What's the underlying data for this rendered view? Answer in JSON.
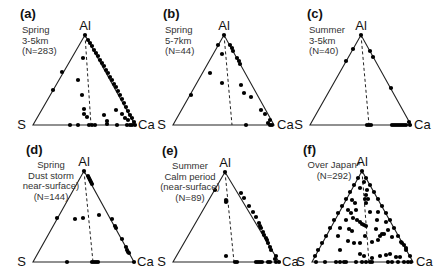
{
  "chart_data": [
    {
      "id": "a",
      "type": "scatter",
      "subtype": "ternary",
      "letter": "(a)",
      "title_lines": [
        "Spring",
        "3-5km",
        "(N=283)"
      ],
      "season": "Spring",
      "altitude": "3-5km",
      "n": 283,
      "vertices": {
        "top": "Al",
        "left": "S",
        "right": "Ca"
      },
      "geometry": {
        "apex": [
          85,
          35
        ],
        "left": [
          33,
          125
        ],
        "right": [
          135,
          125
        ],
        "dash_base_x": 91
      },
      "label_pos": {
        "letter": [
          20,
          18
        ],
        "desc": [
          22,
          33
        ]
      },
      "points_px": [
        [
          85,
          35
        ],
        [
          88,
          40
        ],
        [
          90,
          43
        ],
        [
          92,
          46
        ],
        [
          94,
          50
        ],
        [
          96,
          53
        ],
        [
          98,
          56
        ],
        [
          100,
          60
        ],
        [
          102,
          63
        ],
        [
          104,
          66
        ],
        [
          106,
          70
        ],
        [
          108,
          73
        ],
        [
          110,
          77
        ],
        [
          112,
          80
        ],
        [
          114,
          84
        ],
        [
          116,
          87
        ],
        [
          118,
          91
        ],
        [
          120,
          95
        ],
        [
          122,
          99
        ],
        [
          124,
          103
        ],
        [
          126,
          107
        ],
        [
          128,
          111
        ],
        [
          130,
          115
        ],
        [
          132,
          118
        ],
        [
          134,
          122
        ],
        [
          135,
          125
        ],
        [
          62,
          72
        ],
        [
          53,
          90
        ],
        [
          83,
          58
        ],
        [
          78,
          80
        ],
        [
          82,
          95
        ],
        [
          84,
          109
        ],
        [
          84,
          114
        ],
        [
          87,
          117
        ],
        [
          104,
          115
        ],
        [
          116,
          110
        ],
        [
          122,
          114
        ],
        [
          125,
          118
        ],
        [
          128,
          120
        ],
        [
          107,
          121
        ],
        [
          107,
          124
        ],
        [
          70,
          125
        ],
        [
          78,
          125
        ],
        [
          89,
          125
        ],
        [
          92,
          125
        ],
        [
          95,
          125
        ],
        [
          117,
          125
        ],
        [
          127,
          125
        ],
        [
          130,
          125
        ],
        [
          132,
          125
        ]
      ]
    },
    {
      "id": "b",
      "type": "scatter",
      "subtype": "ternary",
      "letter": "(b)",
      "title_lines": [
        "Spring",
        "5-7km",
        "(N=44)"
      ],
      "season": "Spring",
      "altitude": "5-7km",
      "n": 44,
      "vertices": {
        "top": "Al",
        "left": "S",
        "right": "Ca"
      },
      "geometry": {
        "apex": [
          224,
          35
        ],
        "left": [
          173,
          125
        ],
        "right": [
          274,
          125
        ],
        "dash_base_x": 232
      },
      "label_pos": {
        "letter": [
          163,
          18
        ],
        "desc": [
          165,
          33
        ]
      },
      "points_px": [
        [
          224,
          35
        ],
        [
          218,
          45
        ],
        [
          230,
          45
        ],
        [
          232,
          48
        ],
        [
          233,
          51
        ],
        [
          237,
          58
        ],
        [
          239,
          61
        ],
        [
          240,
          64
        ],
        [
          222,
          54
        ],
        [
          210,
          73
        ],
        [
          222,
          83
        ],
        [
          241,
          85
        ],
        [
          244,
          93
        ],
        [
          251,
          97
        ],
        [
          191,
          95
        ],
        [
          261,
          110
        ],
        [
          265,
          114
        ],
        [
          270,
          120
        ],
        [
          268,
          123
        ],
        [
          272,
          125
        ],
        [
          270,
          125
        ],
        [
          246,
          125
        ]
      ]
    },
    {
      "id": "c",
      "type": "scatter",
      "subtype": "ternary",
      "letter": "(c)",
      "title_lines": [
        "Summer",
        "3-5km",
        "(N=40)"
      ],
      "season": "Summer",
      "altitude": "3-5km",
      "n": 40,
      "vertices": {
        "top": "Al",
        "left": "S",
        "right": "Ca"
      },
      "geometry": {
        "apex": [
          361,
          35
        ],
        "left": [
          310,
          125
        ],
        "right": [
          411,
          125
        ],
        "dash_base_x": 369
      },
      "label_pos": {
        "letter": [
          307,
          18
        ],
        "desc": [
          309,
          33
        ]
      },
      "points_px": [
        [
          361,
          35
        ],
        [
          353,
          49
        ],
        [
          346,
          61
        ],
        [
          370,
          51
        ],
        [
          373,
          57
        ],
        [
          391,
          88
        ],
        [
          409,
          122
        ],
        [
          367,
          125
        ],
        [
          369,
          125
        ],
        [
          371,
          125
        ],
        [
          392,
          125
        ],
        [
          394,
          125
        ],
        [
          396,
          125
        ],
        [
          398,
          125
        ],
        [
          400,
          125
        ],
        [
          402,
          125
        ],
        [
          404,
          125
        ],
        [
          406,
          125
        ],
        [
          410,
          125
        ]
      ]
    },
    {
      "id": "d",
      "type": "scatter",
      "subtype": "ternary",
      "letter": "(d)",
      "title_lines": [
        "Spring",
        "Dust storm",
        "near-surface)",
        "(N=144)"
      ],
      "season": "Spring",
      "condition": "Dust storm near-surface",
      "n": 144,
      "vertices": {
        "top": "Al",
        "left": "S",
        "right": "Ca"
      },
      "geometry": {
        "apex": [
          84,
          171
        ],
        "left": [
          33,
          262
        ],
        "right": [
          134,
          262
        ],
        "dash_base_x": 93
      },
      "label_pos": {
        "letter": [
          26,
          154
        ],
        "desc": [
          51,
          168
        ]
      },
      "points_px": [
        [
          84,
          171
        ],
        [
          88,
          176
        ],
        [
          89,
          178
        ],
        [
          90,
          180
        ],
        [
          91,
          182
        ],
        [
          92,
          184
        ],
        [
          57,
          218
        ],
        [
          75,
          219
        ],
        [
          83,
          218
        ],
        [
          99,
          215
        ],
        [
          112,
          219
        ],
        [
          115,
          226
        ],
        [
          116,
          228
        ],
        [
          122,
          239
        ],
        [
          126,
          247
        ],
        [
          127,
          250
        ],
        [
          128,
          252
        ],
        [
          129,
          253
        ],
        [
          134,
          262
        ],
        [
          67,
          262
        ],
        [
          92,
          262
        ],
        [
          94,
          262
        ],
        [
          96,
          262
        ],
        [
          98,
          262
        ]
      ]
    },
    {
      "id": "e",
      "type": "scatter",
      "subtype": "ternary",
      "letter": "(e)",
      "title_lines": [
        "Summer",
        "Calm period",
        "(near-surface)",
        "(N=89)"
      ],
      "season": "Summer",
      "condition": "Calm period (near-surface)",
      "n": 89,
      "vertices": {
        "top": "Al",
        "left": "S",
        "right": "Ca"
      },
      "geometry": {
        "apex": [
          225,
          172
        ],
        "left": [
          173,
          262
        ],
        "right": [
          279,
          262
        ],
        "dash_base_x": 234
      },
      "label_pos": {
        "letter": [
          162,
          155
        ],
        "desc": [
          190,
          169
        ]
      },
      "points_px": [
        [
          225,
          172
        ],
        [
          215,
          190
        ],
        [
          226,
          200
        ],
        [
          226,
          202
        ],
        [
          241,
          193
        ],
        [
          244,
          198
        ],
        [
          249,
          206
        ],
        [
          253,
          212
        ],
        [
          256,
          217
        ],
        [
          259,
          223
        ],
        [
          260,
          226
        ],
        [
          261,
          228
        ],
        [
          263,
          232
        ],
        [
          264,
          235
        ],
        [
          266,
          238
        ],
        [
          267,
          240
        ],
        [
          268,
          243
        ],
        [
          270,
          247
        ],
        [
          271,
          250
        ],
        [
          276,
          256
        ],
        [
          275,
          259
        ],
        [
          226,
          256
        ],
        [
          235,
          262
        ],
        [
          237,
          262
        ],
        [
          256,
          262
        ],
        [
          258,
          262
        ],
        [
          260,
          262
        ],
        [
          262,
          262
        ],
        [
          268,
          262
        ],
        [
          270,
          262
        ],
        [
          276,
          262
        ],
        [
          279,
          262
        ]
      ]
    },
    {
      "id": "f",
      "type": "scatter",
      "subtype": "ternary",
      "letter": "(f)",
      "title_lines": [
        "Over Japan*",
        "(N=292)"
      ],
      "location": "Over Japan*",
      "n": 292,
      "vertices": {
        "top": "Al",
        "left": "S",
        "right": "Ca"
      },
      "geometry": {
        "apex": [
          362,
          171
        ],
        "left": [
          312,
          262
        ],
        "right": [
          413,
          262
        ],
        "dash_base_x": 369
      },
      "label_pos": {
        "letter": [
          303,
          154
        ],
        "desc": [
          334,
          168
        ]
      },
      "points_px": [
        [
          362,
          171
        ],
        [
          358,
          178
        ],
        [
          354,
          185
        ],
        [
          350,
          192
        ],
        [
          346,
          199
        ],
        [
          342,
          206
        ],
        [
          338,
          213
        ],
        [
          334,
          220
        ],
        [
          330,
          228
        ],
        [
          326,
          236
        ],
        [
          322,
          243
        ],
        [
          318,
          250
        ],
        [
          315,
          256
        ],
        [
          366,
          178
        ],
        [
          370,
          185
        ],
        [
          374,
          192
        ],
        [
          378,
          199
        ],
        [
          382,
          206
        ],
        [
          386,
          213
        ],
        [
          390,
          220
        ],
        [
          394,
          228
        ],
        [
          398,
          236
        ],
        [
          402,
          243
        ],
        [
          406,
          250
        ],
        [
          410,
          256
        ],
        [
          364,
          182
        ],
        [
          360,
          188
        ],
        [
          367,
          190
        ],
        [
          366,
          195
        ],
        [
          365,
          199
        ],
        [
          368,
          199
        ],
        [
          366,
          203
        ],
        [
          352,
          200
        ],
        [
          355,
          203
        ],
        [
          348,
          210
        ],
        [
          351,
          213
        ],
        [
          356,
          210
        ],
        [
          353,
          218
        ],
        [
          346,
          220
        ],
        [
          357,
          220
        ],
        [
          360,
          222
        ],
        [
          362,
          224
        ],
        [
          364,
          225
        ],
        [
          366,
          226
        ],
        [
          370,
          212
        ],
        [
          378,
          212
        ],
        [
          377,
          220
        ],
        [
          386,
          222
        ],
        [
          388,
          230
        ],
        [
          384,
          234
        ],
        [
          380,
          236
        ],
        [
          378,
          240
        ],
        [
          376,
          229
        ],
        [
          349,
          229
        ],
        [
          352,
          231
        ],
        [
          338,
          236
        ],
        [
          340,
          228
        ],
        [
          348,
          241
        ],
        [
          354,
          243
        ],
        [
          360,
          243
        ],
        [
          365,
          236
        ],
        [
          372,
          242
        ],
        [
          382,
          234
        ],
        [
          392,
          237
        ],
        [
          401,
          242
        ],
        [
          404,
          245
        ],
        [
          406,
          248
        ],
        [
          340,
          250
        ],
        [
          360,
          254
        ],
        [
          364,
          256
        ],
        [
          372,
          258
        ],
        [
          380,
          256
        ],
        [
          386,
          255
        ],
        [
          390,
          254
        ],
        [
          396,
          257
        ],
        [
          400,
          257
        ],
        [
          316,
          262
        ],
        [
          325,
          262
        ],
        [
          336,
          262
        ],
        [
          340,
          262
        ],
        [
          344,
          262
        ],
        [
          346,
          262
        ],
        [
          356,
          262
        ],
        [
          362,
          262
        ],
        [
          366,
          262
        ],
        [
          370,
          262
        ],
        [
          372,
          262
        ],
        [
          388,
          262
        ],
        [
          392,
          262
        ],
        [
          398,
          262
        ],
        [
          404,
          262
        ],
        [
          408,
          262
        ],
        [
          411,
          262
        ]
      ]
    }
  ]
}
